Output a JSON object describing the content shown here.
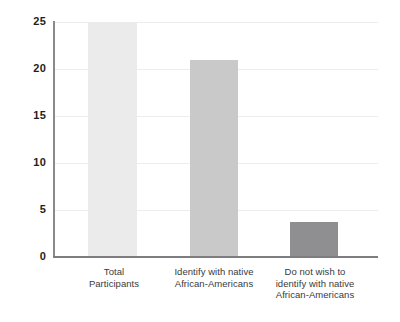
{
  "chart_data": {
    "type": "bar",
    "title": "",
    "subtitle": "",
    "xlabel": "",
    "ylabel": "",
    "ylim": [
      0,
      25
    ],
    "y_ticks": [
      0,
      5,
      10,
      15,
      20,
      25
    ],
    "y_tick_labels": [
      "0",
      "5",
      "10",
      "15",
      "20",
      "25"
    ],
    "grid": true,
    "grid_axis": "y",
    "legend": false,
    "legend_position": "none",
    "categories": [
      "Total Participants",
      "Identify with native African-Americans",
      "Do not wish to identify with native African-Americans"
    ],
    "category_label_lines": [
      [
        "Total",
        "Participants"
      ],
      [
        "Identify with native",
        "African-Americans"
      ],
      [
        "Do not wish to",
        "identify with native",
        "African-Americans"
      ]
    ],
    "values": [
      25,
      21,
      3.7
    ],
    "bar_colors": [
      "#ebebeb",
      "#c9c9ca",
      "#8f8f91"
    ],
    "axis_color": "#7e7e80",
    "gridline_color": "#ededee",
    "tick_label_color": "#231f20",
    "category_label_color": "#3a3a3c",
    "background_color": "#ffffff"
  }
}
